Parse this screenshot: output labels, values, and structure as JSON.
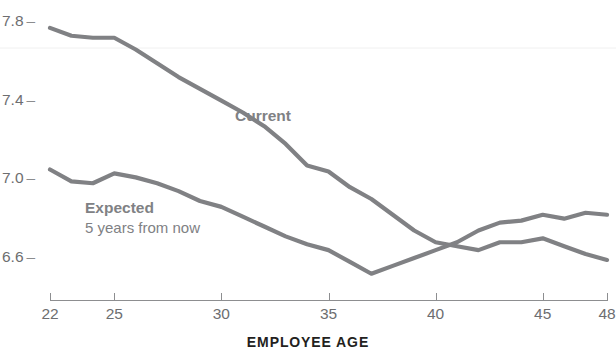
{
  "chart_data": {
    "type": "line",
    "title": "AVERAGE SATISFACTION RATING",
    "xlabel": "EMPLOYEE AGE",
    "ylabel": "",
    "xlim": [
      22,
      48
    ],
    "ylim": [
      6.45,
      7.85
    ],
    "grid": false,
    "legend_position": "inline-annotation",
    "series_color": "#808184",
    "x": [
      22,
      23,
      24,
      25,
      26,
      27,
      28,
      29,
      30,
      31,
      32,
      33,
      34,
      35,
      36,
      37,
      38,
      39,
      40,
      41,
      42,
      43,
      44,
      45,
      46,
      47,
      48
    ],
    "series": [
      {
        "name": "Current",
        "label": "Current",
        "sublabel": "",
        "values": [
          7.77,
          7.73,
          7.72,
          7.72,
          7.66,
          7.59,
          7.52,
          7.46,
          7.4,
          7.34,
          7.27,
          7.18,
          7.07,
          7.04,
          6.96,
          6.9,
          6.82,
          6.74,
          6.68,
          6.66,
          6.64,
          6.68,
          6.68,
          6.7,
          6.66,
          6.62,
          6.59
        ]
      },
      {
        "name": "Expected",
        "label": "Expected",
        "sublabel": "5 years from now",
        "values": [
          7.05,
          6.99,
          6.98,
          7.03,
          7.01,
          6.98,
          6.94,
          6.89,
          6.86,
          6.81,
          6.76,
          6.71,
          6.67,
          6.64,
          6.58,
          6.52,
          6.56,
          6.6,
          6.64,
          6.68,
          6.74,
          6.78,
          6.79,
          6.82,
          6.8,
          6.83,
          6.82
        ]
      }
    ],
    "y_ticks": [
      {
        "label": "7.8",
        "value": 7.8
      },
      {
        "label": "7.4",
        "value": 7.4
      },
      {
        "label": "7.0",
        "value": 7.0
      },
      {
        "label": "6.6",
        "value": 6.6
      }
    ],
    "x_ticks": [
      {
        "label": "22",
        "value": 22
      },
      {
        "label": "25",
        "value": 25
      },
      {
        "label": "30",
        "value": 30
      },
      {
        "label": "35",
        "value": 35
      },
      {
        "label": "40",
        "value": 40
      },
      {
        "label": "45",
        "value": 45
      },
      {
        "label": "48",
        "value": 48
      }
    ]
  }
}
